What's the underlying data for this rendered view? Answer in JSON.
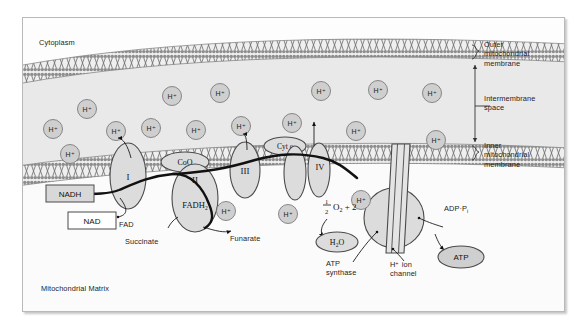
{
  "diagram": {
    "type": "biological-process-diagram",
    "regions": {
      "cytoplasm": "Cytoplasm",
      "matrix": "Mitochondrial Matrix",
      "intermembrane_space": "Intermembrane\nspace"
    },
    "membrane_labels": {
      "outer": "Outer\nmitochondrial\nmembrane",
      "inner": "Inner\nmitochondrial\nmembrane"
    },
    "complexes": [
      {
        "id": "I",
        "label": "I"
      },
      {
        "id": "II",
        "label": "II"
      },
      {
        "id": "III",
        "label": "III"
      },
      {
        "id": "IV",
        "label": "IV"
      }
    ],
    "carriers": [
      {
        "id": "coq",
        "label": "CoQ"
      },
      {
        "id": "cytc",
        "label": "Cyt c"
      }
    ],
    "protons": {
      "label": "H",
      "charge": "+",
      "intermembrane_count": 14,
      "matrix_count": 3
    },
    "substrates": {
      "nadh": "NADH",
      "nad": "NAD",
      "fadh2_name": "FADH",
      "fadh2_sub": "2",
      "fad": "FAD",
      "succinate": "Succinate",
      "fumarate": "Funarate"
    },
    "oxygen": {
      "numerator": "1",
      "denominator": "2",
      "species": "O",
      "species_sub": "2",
      "electrons": "+ 2",
      "water": "H",
      "water_sub": "2",
      "water_tail": "O"
    },
    "atp_machinery": {
      "synthase": "ATP\nsynthase",
      "channel": "H⁺ ion\nchannel",
      "adp": "ADP",
      "adp_dot": "·",
      "adp_pi": "P",
      "adp_pi_sub": "i",
      "atp": "ATP"
    },
    "colors": {
      "frame_border": "#b9b9b9",
      "page_background": "#ffffff",
      "intermembrane_fill": "#e9e9e9",
      "matrix_fill": "#fbfbfb",
      "membrane_gray": "#8d8d8d",
      "protein_fill": "#dcdcdc",
      "protein_stroke": "#4a4a4a",
      "proton_fill": "#cfcfcf",
      "highlighted_box_fill": "#d8d8d8",
      "text": "#1d1d1d",
      "electron_path": "#111111"
    }
  }
}
